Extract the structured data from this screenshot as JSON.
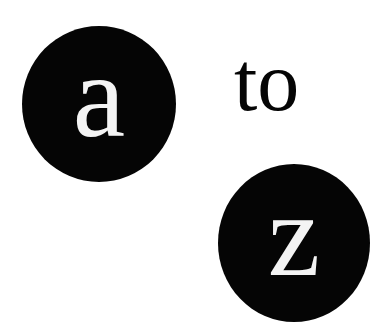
{
  "from_letter": "a",
  "connector": "to",
  "to_letter": "z",
  "colors": {
    "circle": "#050505",
    "letter": "#f4f4f4",
    "background": "#ffffff"
  }
}
